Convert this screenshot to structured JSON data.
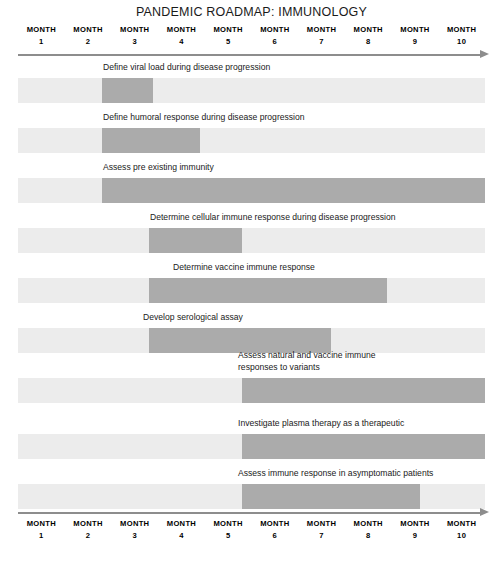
{
  "title": "PANDEMIC ROADMAP: IMMUNOLOGY",
  "axis": {
    "word": "MONTH",
    "months": [
      "1",
      "2",
      "3",
      "4",
      "5",
      "6",
      "7",
      "8",
      "9",
      "10"
    ]
  },
  "tasks": [
    {
      "label": "Define viral load during disease progression"
    },
    {
      "label": "Define humoral response during disease progression"
    },
    {
      "label": "Assess pre existing immunity"
    },
    {
      "label": "Determine cellular immune response during disease progression"
    },
    {
      "label": "Determine vaccine immune response"
    },
    {
      "label": "Develop serological assay"
    },
    {
      "label": "Assess natural and vaccine immune\nresponses to variants"
    },
    {
      "label": "Investigate plasma therapy as a therapeutic"
    },
    {
      "label": "Assess immune response in asymptomatic patients"
    }
  ],
  "colors": {
    "track": "#ececec",
    "segment": "#ababab",
    "axis": "#8d8d8d",
    "text": "#1a1a1a"
  },
  "chart_data": {
    "type": "bar",
    "title": "PANDEMIC ROADMAP: IMMUNOLOGY",
    "xlabel": "MONTH",
    "ylabel": "",
    "xlim": [
      1,
      10
    ],
    "x_tick_labels": [
      "MONTH 1",
      "MONTH 2",
      "MONTH 3",
      "MONTH 4",
      "MONTH 5",
      "MONTH 6",
      "MONTH 7",
      "MONTH 8",
      "MONTH 9",
      "MONTH 10"
    ],
    "grid": false,
    "legend": null,
    "categories": [
      "Define viral load during disease progression",
      "Define humoral response during disease progression",
      "Assess pre existing immunity",
      "Determine cellular immune response during disease progression",
      "Determine vaccine immune response",
      "Develop serological assay",
      "Assess natural and vaccine immune responses to variants",
      "Investigate plasma therapy as a therapeutic",
      "Assess immune response in asymptomatic patients"
    ],
    "series": [
      {
        "name": "Active period (months)",
        "bars": [
          {
            "start_month": 2.8,
            "end_month": 3.9
          },
          {
            "start_month": 2.8,
            "end_month": 4.9
          },
          {
            "start_month": 2.8,
            "end_month": 11.0
          },
          {
            "start_month": 3.8,
            "end_month": 5.8
          },
          {
            "start_month": 3.8,
            "end_month": 8.9
          },
          {
            "start_month": 3.8,
            "end_month": 7.7
          },
          {
            "start_month": 5.8,
            "end_month": 11.0
          },
          {
            "start_month": 5.8,
            "end_month": 11.0
          },
          {
            "start_month": 5.8,
            "end_month": 9.6
          }
        ]
      }
    ],
    "track_extent_months": [
      1.0,
      11.0
    ]
  }
}
